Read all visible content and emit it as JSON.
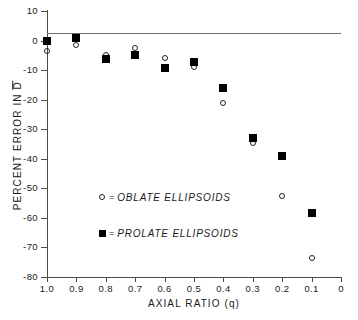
{
  "chart_data": {
    "type": "scatter",
    "title": "",
    "xlabel": "AXIAL RATIO (q)",
    "ylabel": "PERCENT ERROR IN D̅",
    "ylabel_prefix": "PERCENT ERROR IN ",
    "ylabel_symbol": "D",
    "xlim": [
      1.0,
      0.0
    ],
    "ylim": [
      -80,
      10
    ],
    "x_ticks": [
      "1.0",
      "0.9",
      "0.8",
      "0.7",
      "0.6",
      "0.5",
      "0.4",
      "0.3",
      "0.2",
      "0.1",
      "0"
    ],
    "x_tick_values": [
      1.0,
      0.9,
      0.8,
      0.7,
      0.6,
      0.5,
      0.4,
      0.3,
      0.2,
      0.1,
      0.0
    ],
    "y_ticks": [
      "10",
      "0",
      "-10",
      "-20",
      "-30",
      "-40",
      "-50",
      "-60",
      "-70",
      "-80"
    ],
    "y_tick_values": [
      10,
      0,
      -10,
      -20,
      -30,
      -40,
      -50,
      -60,
      -70,
      -80
    ],
    "grid": false,
    "zero_reference_line": 0,
    "legend_position": "center-left-inside",
    "series": [
      {
        "name": "OBLATE ELLIPSOIDS",
        "marker": "open-circle",
        "legend_label": "= OBLATE ELLIPSOIDS",
        "x": [
          1.0,
          0.9,
          0.8,
          0.7,
          0.6,
          0.5,
          0.4,
          0.3,
          0.2,
          0.1
        ],
        "values": [
          -3.5,
          -1.5,
          -5.0,
          -2.5,
          -5.8,
          -8.8,
          -21.0,
          -34.5,
          -52.5,
          -73.5
        ]
      },
      {
        "name": "PROLATE ELLIPSOIDS",
        "marker": "filled-square",
        "legend_label": "= PROLATE ELLIPSOIDS",
        "x": [
          1.0,
          0.9,
          0.8,
          0.7,
          0.6,
          0.5,
          0.4,
          0.3,
          0.2,
          0.1
        ],
        "values": [
          0.0,
          0.8,
          -6.2,
          -5.0,
          -9.2,
          -7.2,
          -16.2,
          -33.0,
          -39.2,
          -58.5
        ]
      }
    ]
  },
  "legend": {
    "rows": [
      {
        "equals": "=",
        "label": "OBLATE ELLIPSOIDS"
      },
      {
        "equals": "=",
        "label": "PROLATE ELLIPSOIDS"
      }
    ]
  },
  "colors": {
    "axis": "#4a4a4a",
    "zero_line": "#6e6e6e",
    "marker_fill": "#000000",
    "marker_stroke": "#222222",
    "text": "#1a1a1a",
    "background": "#ffffff"
  }
}
